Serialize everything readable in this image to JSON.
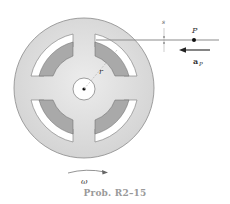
{
  "figure": {
    "caption": "Prob. R2–15",
    "labels": {
      "s": "s",
      "P": "P",
      "a": "a",
      "a_sub": "P",
      "r": "r",
      "omega": "ω"
    },
    "colors": {
      "disc": "#dcdcdc",
      "disc_edge": "#8a8a8a",
      "coil": "#a9a9a9",
      "slot": "#ffffff",
      "tape": "#8c8c8c",
      "caption": "#9a9a9a"
    }
  }
}
